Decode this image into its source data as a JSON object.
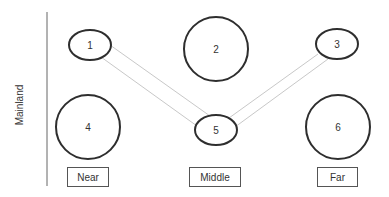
{
  "diagram": {
    "axis_label": "Mainland",
    "colors": {
      "node_stroke": "#2e2e2e",
      "link_stroke": "#c8c8c8",
      "box_stroke": "#555555",
      "text": "#333333",
      "background": "#ffffff"
    },
    "nodes": [
      {
        "id": "1",
        "label": "1",
        "shape": "ellipse",
        "zone": "Near",
        "row": "top"
      },
      {
        "id": "2",
        "label": "2",
        "shape": "circle",
        "zone": "Middle",
        "row": "top"
      },
      {
        "id": "3",
        "label": "3",
        "shape": "ellipse",
        "zone": "Far",
        "row": "top"
      },
      {
        "id": "4",
        "label": "4",
        "shape": "circle",
        "zone": "Near",
        "row": "bottom"
      },
      {
        "id": "5",
        "label": "5",
        "shape": "ellipse",
        "zone": "Middle",
        "row": "bottom"
      },
      {
        "id": "6",
        "label": "6",
        "shape": "circle",
        "zone": "Far",
        "row": "bottom"
      }
    ],
    "links": [
      {
        "from": "1",
        "to": "5",
        "style": "double-line"
      },
      {
        "from": "5",
        "to": "3",
        "style": "double-line"
      }
    ],
    "zones": [
      {
        "label": "Near"
      },
      {
        "label": "Middle"
      },
      {
        "label": "Far"
      }
    ]
  }
}
